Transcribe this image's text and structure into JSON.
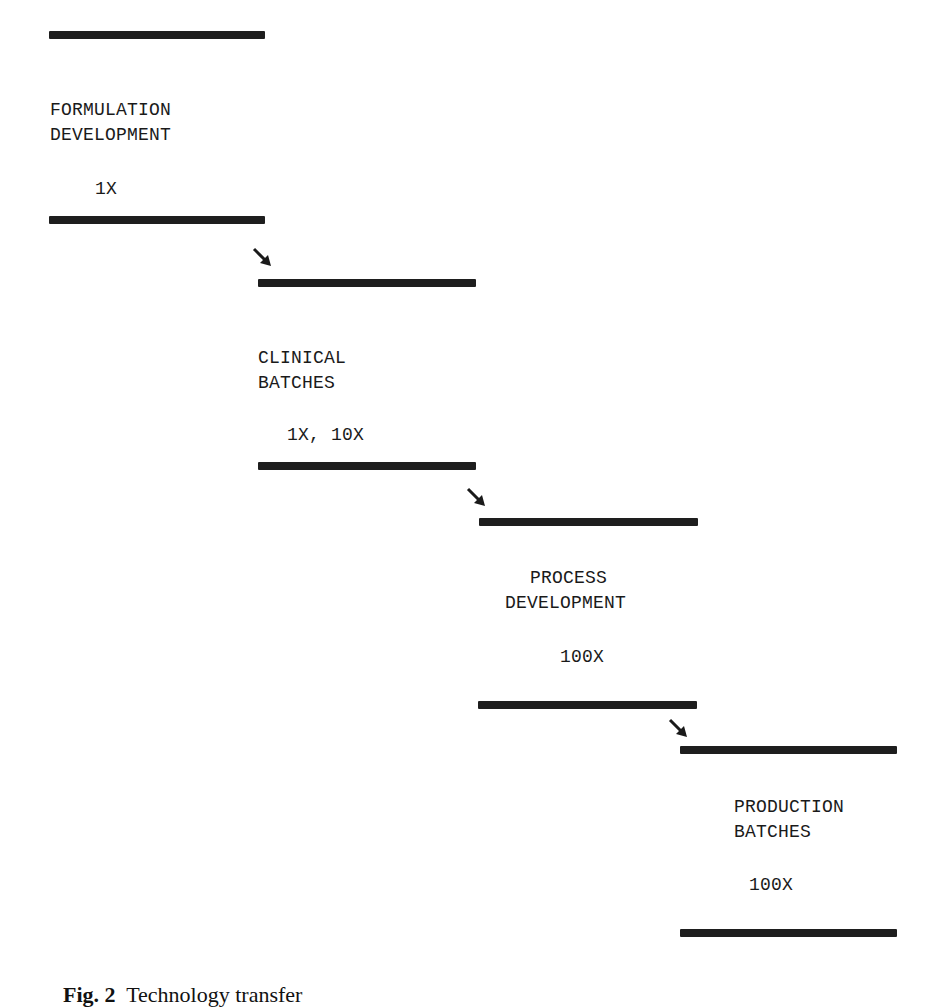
{
  "diagram": {
    "type": "staircase-flow",
    "stages": [
      {
        "title_line1": "FORMULATION",
        "title_line2": "DEVELOPMENT",
        "scale": "1X"
      },
      {
        "title_line1": "CLINICAL",
        "title_line2": "BATCHES",
        "scale": "1X, 10X"
      },
      {
        "title_line1": "PROCESS",
        "title_line2": "DEVELOPMENT",
        "scale": "100X"
      },
      {
        "title_line1": "PRODUCTION",
        "title_line2": "BATCHES",
        "scale": "100X"
      }
    ],
    "connectors": [
      {
        "from": 0,
        "to": 1,
        "icon": "arrow-down-right-icon"
      },
      {
        "from": 1,
        "to": 2,
        "icon": "arrow-down-right-icon"
      },
      {
        "from": 2,
        "to": 3,
        "icon": "arrow-down-right-icon"
      }
    ]
  },
  "caption": {
    "label": "Fig. 2",
    "text": "Technology transfer"
  }
}
